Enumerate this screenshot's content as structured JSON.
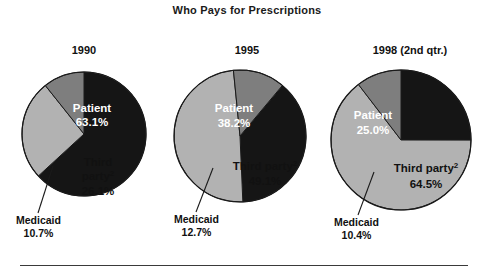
{
  "title": "Who Pays for Prescriptions",
  "colors": {
    "patient": "#151515",
    "third_party": "#b2b2b2",
    "medicaid": "#7e7e7e",
    "outline": "#1a1a1a",
    "label_on_dark": "#ffffff",
    "label_on_light": "#111111",
    "rule": "#3a3a3a",
    "background": "#ffffff"
  },
  "panels": [
    {
      "year": "1990",
      "patient_label": "Patient",
      "patient_value": "63.1%",
      "third_label": "Third",
      "third_label2": "party",
      "third_sup": "2",
      "third_value": "26.1%",
      "medicaid_label": "Medicaid",
      "medicaid_value": "10.7%"
    },
    {
      "year": "1995",
      "patient_label": "Patient",
      "patient_value": "38.2%",
      "third_label": "Third party",
      "third_sup": "2",
      "third_value": "49.1%",
      "medicaid_label": "Medicaid",
      "medicaid_value": "12.7%"
    },
    {
      "year": "1998 (2nd qtr.)",
      "patient_label": "Patient",
      "patient_value": "25.0%",
      "third_label": "Third party",
      "third_sup": "2",
      "third_value": "64.5%",
      "medicaid_label": "Medicaid",
      "medicaid_value": "10.4%"
    }
  ],
  "chart_data": {
    "type": "pie",
    "title": "Who Pays for Prescriptions",
    "xlabel": "",
    "ylabel": "",
    "legend_position": "none",
    "grid": false,
    "units": "percent",
    "categories": [
      "Patient",
      "Third party",
      "Medicaid"
    ],
    "charts": [
      {
        "name": "1990",
        "labels": [
          "Patient",
          "Third party",
          "Medicaid"
        ],
        "values": [
          63.1,
          26.1,
          10.7
        ],
        "colors": [
          "#151515",
          "#b2b2b2",
          "#7e7e7e"
        ]
      },
      {
        "name": "1995",
        "labels": [
          "Patient",
          "Third party",
          "Medicaid"
        ],
        "values": [
          38.2,
          49.1,
          12.7
        ],
        "colors": [
          "#151515",
          "#b2b2b2",
          "#7e7e7e"
        ]
      },
      {
        "name": "1998 (2nd qtr.)",
        "labels": [
          "Patient",
          "Third party",
          "Medicaid"
        ],
        "values": [
          25.0,
          64.5,
          10.4
        ],
        "colors": [
          "#151515",
          "#b2b2b2",
          "#7e7e7e"
        ]
      }
    ],
    "annotations": [
      "Third party carries footnote marker 2"
    ]
  }
}
